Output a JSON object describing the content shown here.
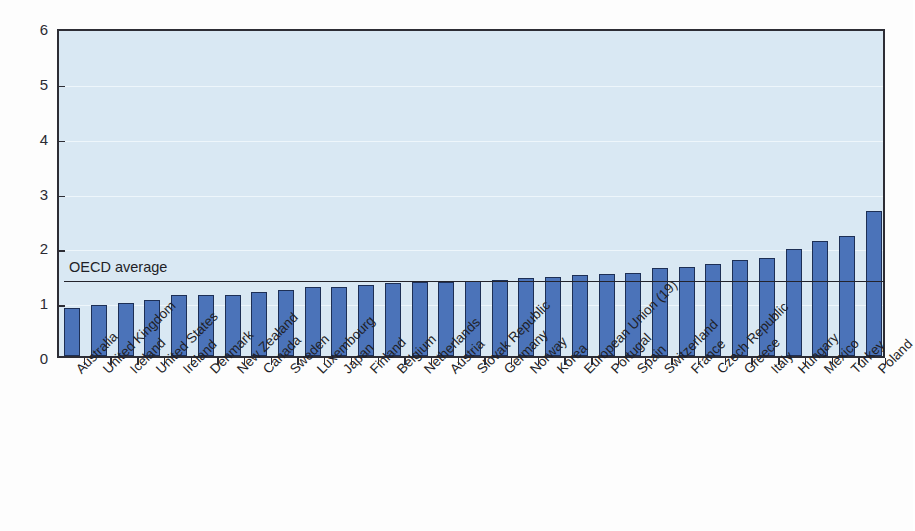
{
  "chart_data": {
    "type": "bar",
    "title": "",
    "xlabel": "",
    "ylabel": "",
    "ylim": [
      0,
      6
    ],
    "ytick_labels": [
      "0",
      "1",
      "2",
      "3",
      "4",
      "5",
      "6"
    ],
    "yticks": [
      0,
      1,
      2,
      3,
      4,
      5,
      6
    ],
    "grid": true,
    "legend_position": "none",
    "bar_color": "#4b73b9",
    "bar_edge_color": "#1d2f55",
    "plot_background": "#d9e8f3",
    "axis_color": "#2d2d35",
    "annotations": [
      {
        "name": "oecd-average-line",
        "label": "OECD average",
        "value": 1.41,
        "type": "horizontal-line",
        "color": "#23232b"
      }
    ],
    "categories": [
      "Australia",
      "United Kingdom",
      "Iceland",
      "United States",
      "Ireland",
      "Denmark",
      "New Zealand",
      "Canada",
      "Sweden",
      "Luxembourg",
      "Japan",
      "Finland",
      "Belgium",
      "Netherlands",
      "Austria",
      "Slovak Republic",
      "Germany",
      "Norway",
      "Korea",
      "European Union (19)",
      "Portugal",
      "Spain",
      "Switzerland",
      "France",
      "Czech Republic",
      "Greece",
      "Italy",
      "Hungary",
      "Mexico",
      "Turkey",
      "Poland"
    ],
    "values": [
      0.88,
      0.93,
      0.96,
      1.03,
      1.11,
      1.12,
      1.12,
      1.16,
      1.21,
      1.25,
      1.26,
      1.3,
      1.33,
      1.35,
      1.35,
      1.37,
      1.39,
      1.42,
      1.44,
      1.47,
      1.49,
      1.52,
      1.61,
      1.63,
      1.67,
      1.75,
      1.79,
      1.95,
      2.09,
      2.19,
      2.65
    ]
  },
  "bleed_text": {
    "line1": "faint reverse-side print bleed-through",
    "line2": ""
  }
}
